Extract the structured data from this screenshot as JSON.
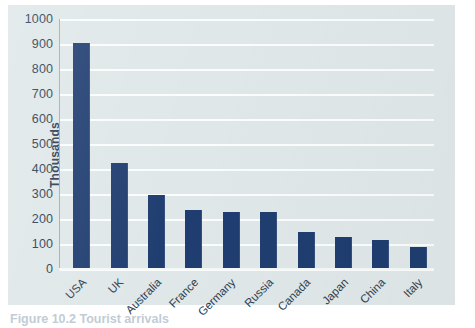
{
  "figure": {
    "caption": "Figure 10.2 Tourist arrivals"
  },
  "axes": {
    "ylabel": "Thousands",
    "yticks": [
      "0",
      "100",
      "200",
      "300",
      "400",
      "500",
      "600",
      "700",
      "800",
      "900",
      "1000"
    ]
  },
  "colors": {
    "bar": "#1f3d70",
    "panel": "#dfe7e8",
    "gridline": "#fbfdfd",
    "text": "#2b3d52"
  },
  "chart_data": {
    "type": "bar",
    "title": "",
    "xlabel": "",
    "ylabel": "Thousands",
    "ylim": [
      0,
      1000
    ],
    "ytick_step": 100,
    "grid": true,
    "legend": false,
    "categories": [
      "USA",
      "UK",
      "Australia",
      "France",
      "Germany",
      "Russia",
      "Canada",
      "Japan",
      "China",
      "Italy"
    ],
    "values": [
      905,
      425,
      295,
      237,
      230,
      228,
      150,
      130,
      118,
      88
    ]
  }
}
